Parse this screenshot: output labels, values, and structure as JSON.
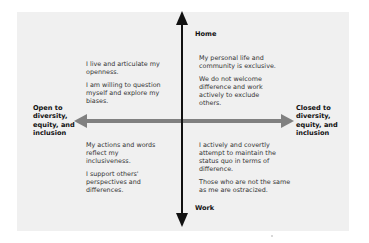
{
  "diagram": {
    "axes": {
      "vertical": {
        "top_label": "Home",
        "bottom_label": "Work",
        "color": "#111111"
      },
      "horizontal": {
        "left_label": "Open to diversity, equity, and inclusion",
        "left_label_lines": [
          "Open to",
          "diversity,",
          "equity, and",
          "inclusion"
        ],
        "right_label": "Closed to diversity, equity, and inclusion",
        "right_label_lines": [
          "Closed to",
          "diversity,",
          "equity, and",
          "inclusion"
        ],
        "color": "#808080"
      }
    },
    "quadrants": {
      "top_left": {
        "paragraphs": [
          "I live and articulate my openness.",
          "I am willing to question myself and explore my biases."
        ]
      },
      "top_right": {
        "paragraphs": [
          "My personal life and community is exclusive.",
          "We do not welcome difference and work actively to exclude others."
        ]
      },
      "bottom_left": {
        "paragraphs": [
          "My actions and words reflect my inclusiveness.",
          "I support others' perspectives and differences."
        ]
      },
      "bottom_right": {
        "paragraphs": [
          "I actively and covertly attempt to maintain the status quo in terms of difference.",
          "Those who are not the same as me are ostracized."
        ]
      }
    },
    "colors": {
      "panel_bg": "#f0f0f0",
      "page_bg": "#ffffff",
      "text": "#333333"
    }
  }
}
